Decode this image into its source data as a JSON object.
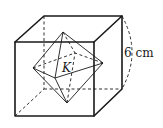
{
  "figure": {
    "cube": {
      "edge_label": "6 cm",
      "front_face": [
        [
          15,
          42
        ],
        [
          94,
          42
        ],
        [
          94,
          116
        ],
        [
          15,
          116
        ]
      ],
      "back_face": [
        [
          44,
          16
        ],
        [
          122,
          16
        ],
        [
          122,
          89
        ],
        [
          44,
          89
        ]
      ]
    },
    "octahedron": {
      "label": "K",
      "vertices": {
        "top": [
          63,
          32
        ],
        "bottom": [
          67,
          103
        ],
        "left": [
          33,
          68
        ],
        "right": [
          103,
          63
        ],
        "front": [
          55,
          78
        ],
        "back": [
          75,
          53
        ]
      }
    },
    "colors": {
      "stroke": "#1a1a1a",
      "background": "#ffffff"
    }
  }
}
